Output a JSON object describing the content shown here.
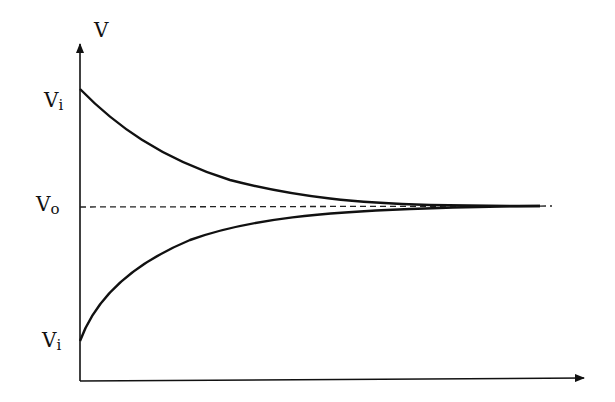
{
  "diagram": {
    "title": "",
    "colors": {
      "stroke": "#111111",
      "background": "#ffffff"
    },
    "axes": {
      "y_label": "V",
      "x_label": "",
      "y_arrow": true,
      "x_arrow": true
    },
    "labels": {
      "v_top": {
        "main": "V",
        "sub": "i"
      },
      "v_mid": {
        "main": "V",
        "sub": "o"
      },
      "v_bottom": {
        "main": "V",
        "sub": "i"
      }
    },
    "asymptote": {
      "label": "V₀",
      "style": "dashed"
    },
    "curves": [
      {
        "name": "decay-from-above",
        "description": "exponential decay from Vi (above) toward Vo"
      },
      {
        "name": "rise-from-below",
        "description": "exponential rise from Vi (below) toward Vo"
      }
    ]
  }
}
